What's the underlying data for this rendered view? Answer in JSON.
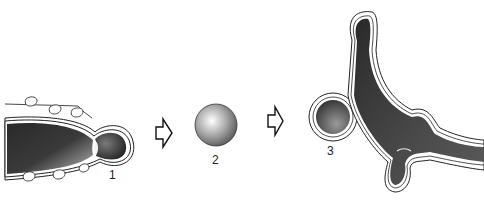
{
  "diagram": {
    "type": "process-sequence",
    "stages": [
      {
        "id": "1",
        "label": "1",
        "description": "hypha tip with swelling bud and surface particles"
      },
      {
        "id": "2",
        "label": "2",
        "description": "detached spherical cell"
      },
      {
        "id": "3",
        "label": "3",
        "description": "germinated cell with branching hypha"
      }
    ],
    "arrows": [
      {
        "from": "1",
        "to": "2",
        "icon": "hollow-arrow-right-icon"
      },
      {
        "from": "2",
        "to": "3",
        "icon": "hollow-arrow-right-icon"
      }
    ]
  }
}
